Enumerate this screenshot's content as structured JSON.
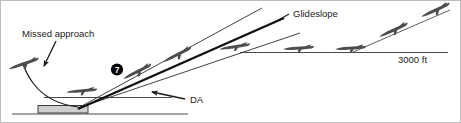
{
  "figure": {
    "labels": {
      "missed_approach": "Missed approach",
      "glideslope": "Glideslope",
      "decision_altitude": "DA",
      "altitude": "3000 ft",
      "step_marker": "7"
    },
    "colors": {
      "line": "#1b1b1b",
      "thin_line": "#2b2b2b",
      "aircraft_fill": "#4d4d4d",
      "runway_fill": "#cfcfcf",
      "runway_stroke": "#3c3c3c",
      "marker_fill": "#000000",
      "marker_text": "#ffffff",
      "background": "#ffffff",
      "border": "#bdbdbd"
    },
    "elements": [
      {
        "name": "ground-line",
        "type": "line",
        "label": ""
      },
      {
        "name": "runway",
        "type": "rect",
        "label": ""
      },
      {
        "name": "decision-altitude-line",
        "type": "line",
        "label": "DA"
      },
      {
        "name": "glideslope-line",
        "type": "line",
        "label": "Glideslope"
      },
      {
        "name": "localizer-upper-line",
        "type": "line",
        "label": ""
      },
      {
        "name": "localizer-lower-line",
        "type": "line",
        "label": ""
      },
      {
        "name": "level-altitude-line",
        "type": "line",
        "label": "3000 ft"
      },
      {
        "name": "missed-approach-curve",
        "type": "curve",
        "label": "Missed approach"
      },
      {
        "name": "step-marker-7",
        "type": "badge",
        "label": "7"
      }
    ],
    "aircraft": [
      {
        "name": "aircraft-missed-approach-climb",
        "x": 22,
        "y": 74,
        "heading": "up-left"
      },
      {
        "name": "aircraft-at-decision-altitude",
        "x": 82,
        "y": 95,
        "heading": "level"
      },
      {
        "name": "aircraft-on-glideslope-low",
        "x": 138,
        "y": 76,
        "heading": "down-left"
      },
      {
        "name": "aircraft-on-glideslope-mid",
        "x": 178,
        "y": 60,
        "heading": "down-left"
      },
      {
        "name": "aircraft-glideslope-intercept",
        "x": 236,
        "y": 48,
        "heading": "down-left"
      },
      {
        "name": "aircraft-level-cruise-1",
        "x": 300,
        "y": 49,
        "heading": "level"
      },
      {
        "name": "aircraft-level-cruise-2",
        "x": 352,
        "y": 49,
        "heading": "level"
      },
      {
        "name": "aircraft-descent-1",
        "x": 395,
        "y": 36,
        "heading": "down-left"
      },
      {
        "name": "aircraft-descent-2",
        "x": 437,
        "y": 16,
        "heading": "down-left"
      }
    ]
  }
}
